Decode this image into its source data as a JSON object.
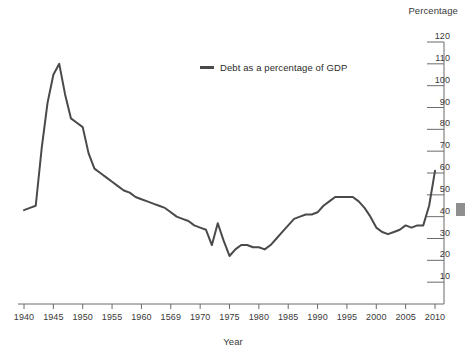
{
  "chart_data": {
    "type": "line",
    "title": "",
    "xlabel": "Year",
    "ylabel": "Percentage",
    "xlim": [
      1940,
      2010
    ],
    "ylim": [
      0,
      120
    ],
    "grid": false,
    "legend_position": "top-center",
    "legend": [
      "Debt as a percentage of GDP"
    ],
    "x_tick_labels": [
      "1940",
      "1945",
      "1950",
      "1955",
      "1960",
      "1569",
      "1970",
      "1975",
      "1980",
      "1985",
      "1990",
      "1995",
      "2000",
      "2005",
      "2010"
    ],
    "x_tick_values": [
      1940,
      1945,
      1950,
      1955,
      1960,
      1965,
      1970,
      1975,
      1980,
      1985,
      1990,
      1995,
      2000,
      2005,
      2010
    ],
    "y_tick_labels": [
      "10",
      "20",
      "30",
      "40",
      "50",
      "60",
      "70",
      "80",
      "90",
      "100",
      "110",
      "120"
    ],
    "y_tick_values": [
      10,
      20,
      30,
      40,
      50,
      60,
      70,
      80,
      90,
      100,
      110,
      120
    ],
    "series": [
      {
        "name": "Debt as a percentage of GDP",
        "color": "#4a4a4a",
        "x": [
          1940,
          1941,
          1942,
          1943,
          1944,
          1945,
          1946,
          1947,
          1948,
          1949,
          1950,
          1951,
          1952,
          1953,
          1954,
          1955,
          1956,
          1957,
          1958,
          1959,
          1960,
          1961,
          1962,
          1963,
          1964,
          1965,
          1966,
          1967,
          1968,
          1969,
          1970,
          1971,
          1972,
          1973,
          1974,
          1975,
          1976,
          1977,
          1978,
          1979,
          1980,
          1981,
          1982,
          1983,
          1984,
          1985,
          1986,
          1987,
          1988,
          1989,
          1990,
          1991,
          1992,
          1993,
          1994,
          1995,
          1996,
          1997,
          1998,
          1999,
          2000,
          2001,
          2002,
          2003,
          2004,
          2005,
          2006,
          2007,
          2008,
          2009,
          2010
        ],
        "y": [
          43,
          44,
          45,
          71,
          92,
          105,
          110,
          96,
          85,
          83,
          81,
          69,
          62,
          60,
          58,
          56,
          54,
          52,
          51,
          49,
          48,
          47,
          46,
          45,
          44,
          42,
          40,
          39,
          38,
          36,
          35,
          34,
          27,
          37,
          29,
          22,
          25,
          27,
          27,
          26,
          26,
          25,
          27,
          30,
          33,
          36,
          39,
          40,
          41,
          41,
          42,
          45,
          47,
          49,
          49,
          49,
          49,
          47,
          44,
          40,
          35,
          33,
          32,
          33,
          34,
          36,
          35,
          36,
          36,
          45,
          61
        ]
      }
    ]
  },
  "plot_geometry": {
    "left_px": 24,
    "right_px": 435,
    "top_px": 42,
    "bottom_px": 304
  }
}
